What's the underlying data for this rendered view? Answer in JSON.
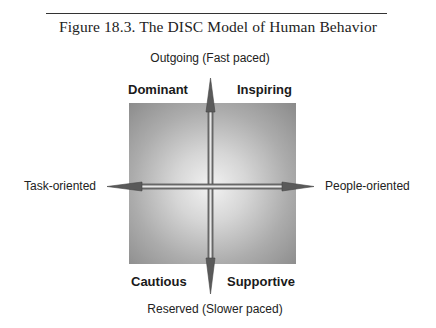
{
  "figure": {
    "title": "Figure 18.3.  The DISC Model of Human Behavior"
  },
  "axes": {
    "top": "Outgoing (Fast paced)",
    "bottom": "Reserved (Slower paced)",
    "left": "Task-oriented",
    "right": "People-oriented"
  },
  "quadrants": {
    "top_left": "Dominant",
    "top_right": "Inspiring",
    "bottom_left": "Cautious",
    "bottom_right": "Supportive"
  },
  "colors": {
    "square_edge": "#8a8a8a",
    "square_center": "#f2f2f2",
    "arrow": "#555555",
    "text": "#222222"
  }
}
